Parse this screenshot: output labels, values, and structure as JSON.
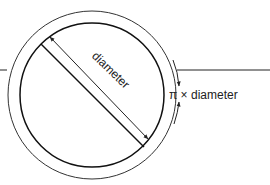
{
  "diagram": {
    "labels": {
      "diameter": "diameter",
      "circumference": "π × diameter"
    },
    "colors": {
      "stroke": "#222222",
      "background": "#ffffff"
    },
    "elements": [
      "outer circle (tyre)",
      "inner circle (wheel)",
      "diameter line with double-headed arrow",
      "ground line",
      "circumference arrows"
    ]
  }
}
